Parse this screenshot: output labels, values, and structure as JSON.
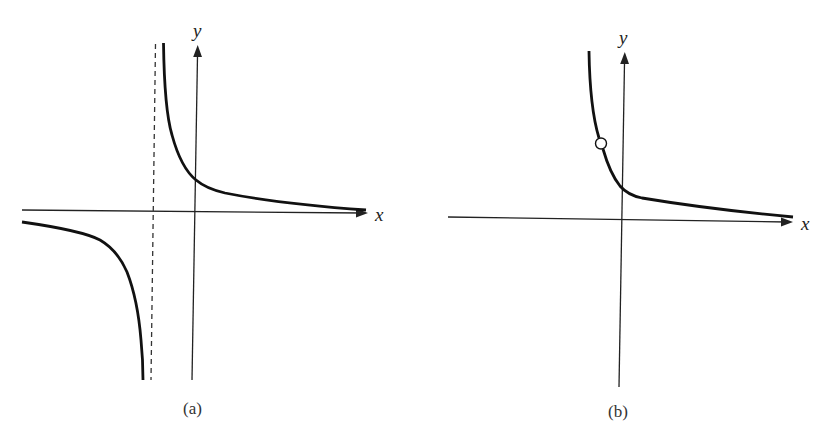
{
  "figure": {
    "panels": [
      {
        "id": "a",
        "label": "(a)",
        "x_axis_label": "x",
        "y_axis_label": "y",
        "description": "Hyperbola-like function with vertical asymptote at negative x (dashed line) and horizontal asymptote y=0; right branch decreasing in first/second quadrant crossing y-axis at positive value, left branch below x-axis diving to -infinity near asymptote",
        "features": {
          "vertical_asymptote": "dashed line left of y-axis",
          "horizontal_asymptote": "x-axis (y = 0)",
          "branches": 2
        }
      },
      {
        "id": "b",
        "label": "(b)",
        "x_axis_label": "x",
        "y_axis_label": "y",
        "description": "Single decreasing branch approaching x-axis as x increases, rising steeply to the left, with an open circle (hole / removable discontinuity) on the curve left of the y-axis",
        "features": {
          "hole": "open circle on curve at negative x",
          "horizontal_asymptote": "x-axis (y = 0)",
          "branches": 1
        }
      }
    ]
  },
  "colors": {
    "background": "#ffffff",
    "curve": "#111111",
    "axis": "#222222"
  }
}
